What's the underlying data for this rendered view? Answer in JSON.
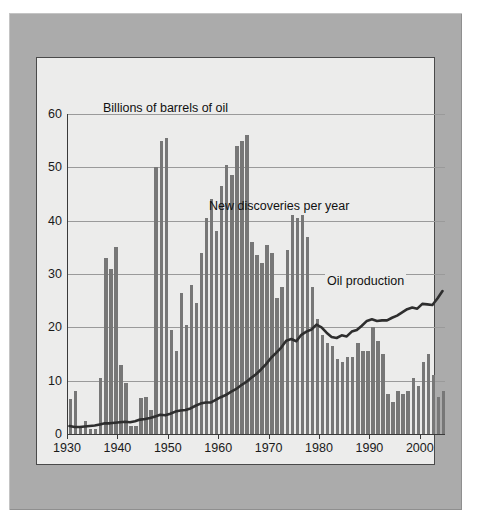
{
  "figure": {
    "frame_color": "#ababab",
    "panel_color": "#ececeb",
    "bar_color": "#777777",
    "line_color": "#2e2e2e",
    "grid_color": "#9a9a9a"
  },
  "chart_data": {
    "type": "bar",
    "title": "",
    "subtitle": "",
    "xlabel": "",
    "ylabel": "Billions of barrels of oil",
    "axis_title_text": "Billions of barrels of oil",
    "grid": true,
    "legend_position": "inline-annotations",
    "xlim": [
      1930,
      2005
    ],
    "ylim": [
      0,
      60
    ],
    "ytick_labels": [
      "0",
      "10",
      "20",
      "30",
      "40",
      "50",
      "60"
    ],
    "yticks": [
      0,
      10,
      20,
      30,
      40,
      50,
      60
    ],
    "xtick_labels": [
      "1930",
      "1940",
      "1950",
      "1960",
      "1970",
      "1980",
      "1990",
      "2000"
    ],
    "xticks": [
      1930,
      1940,
      1950,
      1960,
      1970,
      1980,
      1990,
      2000
    ],
    "annotations": [
      {
        "name": "bars-series-label",
        "text": "New discoveries per year"
      },
      {
        "name": "line-series-label",
        "text": "Oil production"
      }
    ],
    "x": [
      1930,
      1931,
      1932,
      1933,
      1934,
      1935,
      1936,
      1937,
      1938,
      1939,
      1940,
      1941,
      1942,
      1943,
      1944,
      1945,
      1946,
      1947,
      1948,
      1949,
      1950,
      1951,
      1952,
      1953,
      1954,
      1955,
      1956,
      1957,
      1958,
      1959,
      1960,
      1961,
      1962,
      1963,
      1964,
      1965,
      1966,
      1967,
      1968,
      1969,
      1970,
      1971,
      1972,
      1973,
      1974,
      1975,
      1976,
      1977,
      1978,
      1979,
      1980,
      1981,
      1982,
      1983,
      1984,
      1985,
      1986,
      1987,
      1988,
      1989,
      1990,
      1991,
      1992,
      1993,
      1994,
      1995,
      1996,
      1997,
      1998,
      1999,
      2000,
      2001,
      2002,
      2003,
      2004
    ],
    "series": [
      {
        "name": "New discoveries per year",
        "type": "bar",
        "values": [
          6.5,
          8.0,
          1.5,
          2.5,
          1.0,
          1.0,
          10.5,
          33.0,
          31.0,
          35.0,
          13.0,
          9.5,
          1.5,
          1.5,
          6.8,
          7.0,
          4.5,
          50.0,
          55.0,
          55.5,
          19.5,
          15.5,
          26.5,
          20.5,
          28.0,
          24.5,
          34.0,
          40.5,
          44.0,
          38.0,
          46.5,
          50.5,
          48.5,
          54.0,
          55.0,
          56.0,
          36.0,
          33.5,
          32.0,
          35.5,
          34.0,
          25.5,
          27.5,
          34.5,
          41.0,
          40.5,
          41.0,
          37.0,
          27.5,
          21.5,
          18.5,
          17.0,
          16.5,
          14.0,
          13.5,
          14.5,
          14.5,
          17.0,
          15.5,
          15.5,
          20.0,
          17.5,
          15.0,
          7.5,
          6.0,
          8.0,
          7.5,
          8.0,
          10.5,
          9.0,
          13.5,
          15.0,
          11.0,
          7.0,
          8.0
        ]
      },
      {
        "name": "Oil production",
        "type": "line",
        "values": [
          1.5,
          1.3,
          1.3,
          1.4,
          1.5,
          1.6,
          1.8,
          2.0,
          2.0,
          2.1,
          2.2,
          2.3,
          2.2,
          2.4,
          2.7,
          2.8,
          3.0,
          3.3,
          3.6,
          3.5,
          3.8,
          4.2,
          4.4,
          4.5,
          4.8,
          5.3,
          5.7,
          5.9,
          5.9,
          6.4,
          6.9,
          7.3,
          7.9,
          8.4,
          9.1,
          9.7,
          10.5,
          11.2,
          12.1,
          13.1,
          14.3,
          15.2,
          16.2,
          17.5,
          17.8,
          17.4,
          18.6,
          19.2,
          19.6,
          20.5,
          20.0,
          19.0,
          18.2,
          18.0,
          18.5,
          18.3,
          19.2,
          19.5,
          20.3,
          21.2,
          21.5,
          21.2,
          21.3,
          21.3,
          21.8,
          22.2,
          22.8,
          23.4,
          23.7,
          23.5,
          24.4,
          24.3,
          24.2,
          25.4,
          26.8
        ]
      }
    ]
  }
}
